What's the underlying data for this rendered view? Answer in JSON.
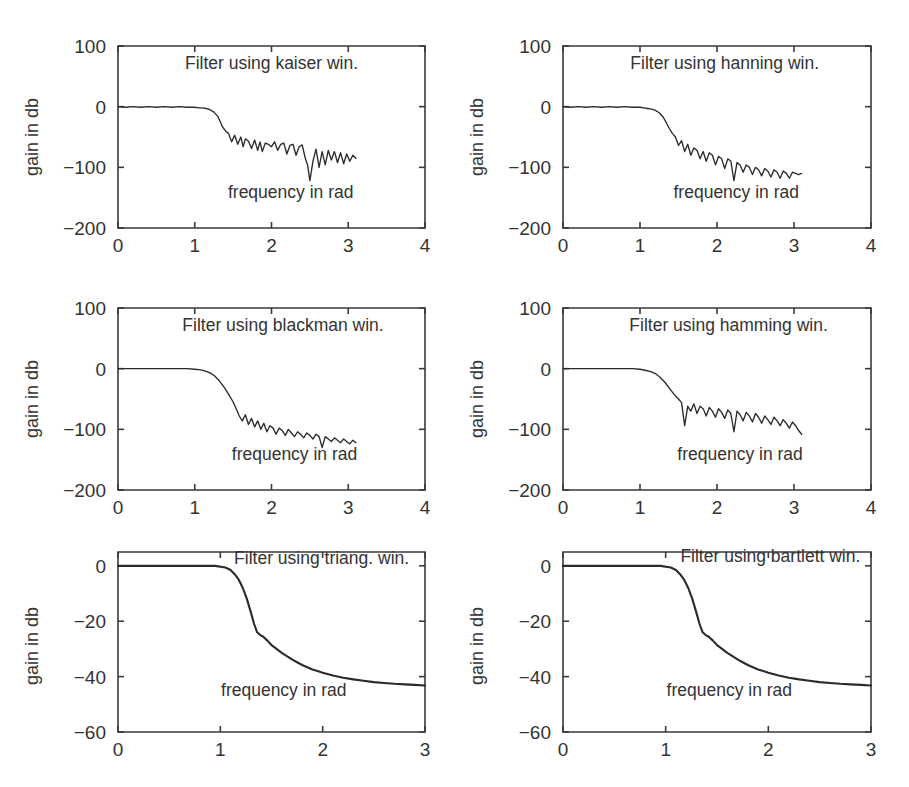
{
  "figure": {
    "background_color": "#ffffff",
    "line_color": "#2b2b2b",
    "axis_color": "#3a3a3a",
    "rows": 3,
    "cols": 2
  },
  "chart_data": [
    {
      "id": "kaiser",
      "type": "line",
      "title": "Filter using kaiser win.",
      "xlabel": "frequency in rad",
      "ylabel": "gain in db",
      "xlim": [
        0,
        4
      ],
      "ylim": [
        -200,
        100
      ],
      "xticks": [
        0,
        1,
        2,
        3,
        4
      ],
      "yticks": [
        100,
        0,
        -100,
        -200
      ],
      "xticklabels": [
        "0",
        "1",
        "2",
        "3",
        "4"
      ],
      "yticklabels": [
        "100",
        "0",
        "-100",
        "-200"
      ],
      "grid": false,
      "legend": "none",
      "annotations": [
        {
          "text": "Filter using kaiser win.",
          "x": 2.0,
          "y": 62
        },
        {
          "text": "frequency in rad",
          "x": 2.25,
          "y": -150
        }
      ],
      "series": [
        {
          "name": "magnitude response",
          "x": [
            0.0,
            0.1,
            0.2,
            0.3,
            0.4,
            0.5,
            0.6,
            0.7,
            0.8,
            0.9,
            1.0,
            1.05,
            1.1,
            1.15,
            1.2,
            1.25,
            1.3,
            1.33,
            1.36,
            1.4,
            1.44,
            1.48,
            1.52,
            1.56,
            1.6,
            1.63,
            1.66,
            1.7,
            1.74,
            1.78,
            1.82,
            1.85,
            1.88,
            1.92,
            1.96,
            2.0,
            2.04,
            2.08,
            2.12,
            2.16,
            2.2,
            2.24,
            2.28,
            2.32,
            2.36,
            2.4,
            2.44,
            2.47,
            2.5,
            2.54,
            2.58,
            2.62,
            2.66,
            2.7,
            2.74,
            2.78,
            2.82,
            2.86,
            2.9,
            2.94,
            2.98,
            3.02,
            3.06,
            3.1
          ],
          "y": [
            0,
            -1,
            0,
            -1,
            0,
            -1,
            0,
            -1,
            0,
            -1,
            -1,
            -2,
            -2,
            -3,
            -5,
            -9,
            -16,
            -24,
            -33,
            -40,
            -44,
            -58,
            -47,
            -62,
            -50,
            -66,
            -53,
            -57,
            -69,
            -55,
            -72,
            -58,
            -74,
            -60,
            -62,
            -66,
            -58,
            -72,
            -62,
            -60,
            -78,
            -64,
            -62,
            -80,
            -66,
            -63,
            -85,
            -96,
            -122,
            -90,
            -70,
            -100,
            -74,
            -96,
            -72,
            -88,
            -74,
            -92,
            -76,
            -94,
            -78,
            -90,
            -80,
            -85
          ]
        }
      ]
    },
    {
      "id": "hanning",
      "type": "line",
      "title": "Filter using hanning win.",
      "xlabel": "frequency in rad",
      "ylabel": "gain in db",
      "xlim": [
        0,
        4
      ],
      "ylim": [
        -200,
        100
      ],
      "xticks": [
        0,
        1,
        2,
        3,
        4
      ],
      "yticks": [
        100,
        0,
        -100,
        -200
      ],
      "xticklabels": [
        "0",
        "1",
        "2",
        "3",
        "4"
      ],
      "yticklabels": [
        "100",
        "0",
        "-100",
        "-200"
      ],
      "grid": false,
      "legend": "none",
      "annotations": [
        {
          "text": "Filter using hanning win.",
          "x": 2.1,
          "y": 62
        },
        {
          "text": "frequency in rad",
          "x": 2.25,
          "y": -150
        }
      ],
      "series": [
        {
          "name": "magnitude response",
          "x": [
            0.0,
            0.1,
            0.2,
            0.3,
            0.4,
            0.5,
            0.6,
            0.7,
            0.8,
            0.9,
            1.0,
            1.05,
            1.1,
            1.15,
            1.2,
            1.25,
            1.3,
            1.34,
            1.38,
            1.42,
            1.46,
            1.5,
            1.54,
            1.58,
            1.62,
            1.66,
            1.7,
            1.74,
            1.78,
            1.82,
            1.86,
            1.9,
            1.94,
            1.98,
            2.02,
            2.06,
            2.1,
            2.14,
            2.18,
            2.22,
            2.26,
            2.3,
            2.34,
            2.38,
            2.42,
            2.46,
            2.5,
            2.54,
            2.58,
            2.62,
            2.66,
            2.7,
            2.74,
            2.78,
            2.82,
            2.86,
            2.9,
            2.94,
            2.98,
            3.02,
            3.06,
            3.1
          ],
          "y": [
            0,
            -1,
            0,
            -1,
            0,
            -1,
            0,
            -1,
            0,
            -1,
            -1,
            -2,
            -3,
            -4,
            -6,
            -10,
            -17,
            -26,
            -36,
            -44,
            -50,
            -64,
            -56,
            -74,
            -62,
            -80,
            -68,
            -72,
            -86,
            -74,
            -90,
            -76,
            -80,
            -96,
            -82,
            -86,
            -102,
            -86,
            -90,
            -122,
            -92,
            -96,
            -108,
            -96,
            -100,
            -112,
            -100,
            -104,
            -114,
            -102,
            -106,
            -116,
            -104,
            -108,
            -118,
            -106,
            -110,
            -118,
            -108,
            -110,
            -112,
            -110
          ]
        }
      ]
    },
    {
      "id": "blackman",
      "type": "line",
      "title": "Filter using blackman win.",
      "xlabel": "frequency in rad",
      "ylabel": "gain in db",
      "xlim": [
        0,
        4
      ],
      "ylim": [
        -200,
        100
      ],
      "xticks": [
        0,
        1,
        2,
        3,
        4
      ],
      "yticks": [
        100,
        0,
        -100,
        -200
      ],
      "xticklabels": [
        "0",
        "1",
        "2",
        "3",
        "4"
      ],
      "yticklabels": [
        "100",
        "0",
        "-100",
        "-200"
      ],
      "grid": false,
      "legend": "none",
      "annotations": [
        {
          "text": "Filter using blackman win.",
          "x": 2.15,
          "y": 62
        },
        {
          "text": "frequency in rad",
          "x": 2.3,
          "y": -150
        }
      ],
      "series": [
        {
          "name": "magnitude response",
          "x": [
            0.0,
            0.15,
            0.3,
            0.45,
            0.6,
            0.75,
            0.9,
            1.0,
            1.08,
            1.14,
            1.2,
            1.26,
            1.32,
            1.38,
            1.44,
            1.5,
            1.54,
            1.58,
            1.62,
            1.66,
            1.7,
            1.74,
            1.78,
            1.82,
            1.86,
            1.9,
            1.94,
            1.98,
            2.02,
            2.06,
            2.1,
            2.14,
            2.18,
            2.22,
            2.26,
            2.3,
            2.34,
            2.38,
            2.42,
            2.46,
            2.5,
            2.54,
            2.58,
            2.62,
            2.66,
            2.7,
            2.74,
            2.78,
            2.82,
            2.86,
            2.9,
            2.94,
            2.98,
            3.02,
            3.06,
            3.1
          ],
          "y": [
            0,
            0,
            0,
            0,
            0,
            0,
            0,
            -1,
            -2,
            -4,
            -7,
            -12,
            -20,
            -30,
            -42,
            -55,
            -66,
            -78,
            -86,
            -76,
            -92,
            -82,
            -96,
            -86,
            -100,
            -90,
            -104,
            -94,
            -98,
            -108,
            -98,
            -102,
            -110,
            -100,
            -106,
            -112,
            -104,
            -108,
            -114,
            -106,
            -110,
            -116,
            -108,
            -112,
            -130,
            -112,
            -116,
            -120,
            -114,
            -118,
            -122,
            -116,
            -120,
            -124,
            -118,
            -122
          ]
        }
      ]
    },
    {
      "id": "hamming",
      "type": "line",
      "title": "Filter using hamming win.",
      "xlabel": "frequency in rad",
      "ylabel": "gain in db",
      "xlim": [
        0,
        4
      ],
      "ylim": [
        -200,
        100
      ],
      "xticks": [
        0,
        1,
        2,
        3,
        4
      ],
      "yticks": [
        100,
        0,
        -100,
        -200
      ],
      "xticklabels": [
        "0",
        "1",
        "2",
        "3",
        "4"
      ],
      "yticklabels": [
        "100",
        "0",
        "-100",
        "-200"
      ],
      "grid": false,
      "legend": "none",
      "annotations": [
        {
          "text": "Filter using hamming win.",
          "x": 2.15,
          "y": 62
        },
        {
          "text": "frequency in rad",
          "x": 2.3,
          "y": -150
        }
      ],
      "series": [
        {
          "name": "magnitude response",
          "x": [
            0.0,
            0.15,
            0.3,
            0.45,
            0.6,
            0.75,
            0.9,
            1.0,
            1.08,
            1.14,
            1.2,
            1.26,
            1.32,
            1.38,
            1.44,
            1.5,
            1.54,
            1.58,
            1.62,
            1.66,
            1.7,
            1.74,
            1.78,
            1.82,
            1.86,
            1.9,
            1.94,
            1.98,
            2.02,
            2.06,
            2.1,
            2.14,
            2.18,
            2.22,
            2.26,
            2.3,
            2.34,
            2.38,
            2.42,
            2.46,
            2.5,
            2.54,
            2.58,
            2.62,
            2.66,
            2.7,
            2.74,
            2.78,
            2.82,
            2.86,
            2.9,
            2.94,
            2.98,
            3.02,
            3.06,
            3.1
          ],
          "y": [
            0,
            0,
            0,
            0,
            0,
            0,
            0,
            -1,
            -3,
            -5,
            -8,
            -14,
            -22,
            -32,
            -42,
            -50,
            -56,
            -94,
            -62,
            -70,
            -58,
            -74,
            -62,
            -66,
            -78,
            -64,
            -70,
            -80,
            -66,
            -72,
            -82,
            -68,
            -74,
            -104,
            -70,
            -76,
            -86,
            -72,
            -78,
            -88,
            -74,
            -80,
            -90,
            -78,
            -84,
            -92,
            -80,
            -86,
            -94,
            -84,
            -90,
            -98,
            -88,
            -94,
            -102,
            -108
          ]
        }
      ]
    },
    {
      "id": "triang",
      "type": "line",
      "title": "Filter using triang. win.",
      "xlabel": "frequency in rad",
      "ylabel": "gain in db",
      "xlim": [
        0,
        3
      ],
      "ylim": [
        -60,
        5
      ],
      "xticks": [
        0,
        1,
        2,
        3
      ],
      "yticks": [
        0,
        -20,
        -40,
        -60
      ],
      "xticklabels": [
        "0",
        "1",
        "2",
        "3"
      ],
      "yticklabels": [
        "0",
        "-20",
        "-40",
        "-60"
      ],
      "grid": false,
      "legend": "none",
      "annotations": [
        {
          "text": "Filter using triang. win.",
          "x": 1.99,
          "y": 0.5
        },
        {
          "text": "frequency in rad",
          "x": 1.62,
          "y": -47
        }
      ],
      "series": [
        {
          "name": "magnitude response",
          "x": [
            0.0,
            0.2,
            0.4,
            0.6,
            0.8,
            0.95,
            1.05,
            1.1,
            1.14,
            1.18,
            1.22,
            1.26,
            1.3,
            1.33,
            1.36,
            1.39,
            1.42,
            1.46,
            1.5,
            1.55,
            1.6,
            1.65,
            1.7,
            1.75,
            1.8,
            1.85,
            1.9,
            1.95,
            2.0,
            2.1,
            2.2,
            2.3,
            2.4,
            2.5,
            2.6,
            2.7,
            2.8,
            2.9,
            3.0
          ],
          "y": [
            0,
            0,
            0,
            0,
            0,
            0,
            -0.6,
            -1.5,
            -3,
            -5,
            -8,
            -12,
            -17,
            -21,
            -24,
            -25,
            -25.6,
            -27,
            -28.6,
            -30,
            -31.4,
            -32.6,
            -33.8,
            -34.8,
            -35.8,
            -36.6,
            -37.4,
            -38,
            -38.6,
            -39.6,
            -40.4,
            -41,
            -41.5,
            -42,
            -42.3,
            -42.6,
            -42.8,
            -43,
            -43.2
          ]
        }
      ]
    },
    {
      "id": "bartlett",
      "type": "line",
      "title": "Filter using bartlett win.",
      "xlabel": "frequency in rad",
      "ylabel": "gain in db",
      "xlim": [
        0,
        3
      ],
      "ylim": [
        -60,
        5
      ],
      "xticks": [
        0,
        1,
        2,
        3
      ],
      "yticks": [
        0,
        -20,
        -40,
        -60
      ],
      "xticklabels": [
        "0",
        "1",
        "2",
        "3"
      ],
      "yticklabels": [
        "0",
        "-20",
        "-40",
        "-60"
      ],
      "grid": false,
      "legend": "none",
      "annotations": [
        {
          "text": "Filter using bartlett win.",
          "x": 2.02,
          "y": 1.5
        },
        {
          "text": "frequency in rad",
          "x": 1.62,
          "y": -47
        }
      ],
      "series": [
        {
          "name": "magnitude response",
          "x": [
            0.0,
            0.2,
            0.4,
            0.6,
            0.8,
            0.95,
            1.05,
            1.1,
            1.14,
            1.18,
            1.22,
            1.26,
            1.3,
            1.33,
            1.36,
            1.39,
            1.42,
            1.46,
            1.5,
            1.55,
            1.6,
            1.65,
            1.7,
            1.75,
            1.8,
            1.85,
            1.9,
            1.95,
            2.0,
            2.1,
            2.2,
            2.3,
            2.4,
            2.5,
            2.6,
            2.7,
            2.8,
            2.9,
            3.0
          ],
          "y": [
            0,
            0,
            0,
            0,
            0,
            0,
            -0.6,
            -1.5,
            -3,
            -5,
            -8,
            -12,
            -17,
            -21,
            -24,
            -25,
            -25.6,
            -27,
            -28.6,
            -30,
            -31.4,
            -32.6,
            -33.8,
            -34.8,
            -35.8,
            -36.6,
            -37.4,
            -38,
            -38.6,
            -39.6,
            -40.4,
            -41,
            -41.5,
            -42,
            -42.3,
            -42.6,
            -42.8,
            -43,
            -43.2
          ]
        }
      ]
    }
  ]
}
